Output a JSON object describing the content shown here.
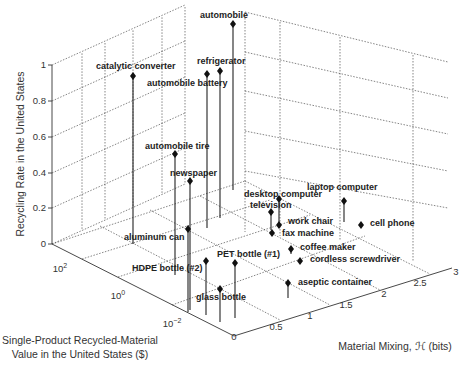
{
  "chart_data": {
    "type": "scatter",
    "subtype": "3d-stem",
    "title": "",
    "xlabel": "Material Mixing, ℋ (bits)",
    "ylabel": "Single-Product Recycled-Material Value in the United States ($)",
    "zlabel": "Recycling Rate in the United States",
    "xlim": [
      0,
      3
    ],
    "ylim_log10": [
      -3,
      3
    ],
    "zlim": [
      0,
      1
    ],
    "x_ticks": [
      "0",
      "0.5",
      "1",
      "1.5",
      "2",
      "2.5",
      "3"
    ],
    "y_ticks": [
      "10−2",
      "10⁰",
      "10²"
    ],
    "z_ticks": [
      "0",
      "0.2",
      "0.4",
      "0.6",
      "0.8",
      "1"
    ],
    "grid": true,
    "points": [
      {
        "label": "automobile",
        "mixing_bits": 0.35,
        "value_log10": 2.6,
        "recycling_rate": 0.98
      },
      {
        "label": "refrigerator",
        "mixing_bits": 0.3,
        "value_log10": 1.5,
        "recycling_rate": 0.9
      },
      {
        "label": "automobile battery",
        "mixing_bits": 0.2,
        "value_log10": 1.2,
        "recycling_rate": 0.95
      },
      {
        "label": "catalytic converter",
        "mixing_bits": 0.05,
        "value_log10": 2.0,
        "recycling_rate": 0.95
      },
      {
        "label": "automobile tire",
        "mixing_bits": 0.15,
        "value_log10": 0.2,
        "recycling_rate": 0.35
      },
      {
        "label": "newspaper",
        "mixing_bits": 0.1,
        "value_log10": -1.0,
        "recycling_rate": 0.5
      },
      {
        "label": "aluminum can",
        "mixing_bits": 0.1,
        "value_log10": -1.5,
        "recycling_rate": 0.45
      },
      {
        "label": "HDPE bottle (#2)",
        "mixing_bits": 0.15,
        "value_log10": -2.2,
        "recycling_rate": 0.3
      },
      {
        "label": "PET bottle (#1)",
        "mixing_bits": 0.3,
        "value_log10": -2.0,
        "recycling_rate": 0.25
      },
      {
        "label": "glass bottle",
        "mixing_bits": 0.25,
        "value_log10": -2.3,
        "recycling_rate": 0.25
      },
      {
        "label": "desktop computer",
        "mixing_bits": 1.7,
        "value_log10": 0.5,
        "recycling_rate": 0.2
      },
      {
        "label": "television",
        "mixing_bits": 1.6,
        "value_log10": 0.8,
        "recycling_rate": 0.15
      },
      {
        "label": "work chair",
        "mixing_bits": 1.6,
        "value_log10": 0.2,
        "recycling_rate": 0.05
      },
      {
        "label": "fax machine",
        "mixing_bits": 1.5,
        "value_log10": 0.6,
        "recycling_rate": 0.02
      },
      {
        "label": "laptop computer",
        "mixing_bits": 2.3,
        "value_log10": 0.5,
        "recycling_rate": 0.1
      },
      {
        "label": "cell phone",
        "mixing_bits": 2.5,
        "value_log10": 0.0,
        "recycling_rate": 0.01
      },
      {
        "label": "coffee maker",
        "mixing_bits": 1.5,
        "value_log10": -0.5,
        "recycling_rate": 0.02
      },
      {
        "label": "cordless screwdriver",
        "mixing_bits": 1.7,
        "value_log10": -0.8,
        "recycling_rate": 0.01
      },
      {
        "label": "aseptic container",
        "mixing_bits": 1.1,
        "value_log10": -2.0,
        "recycling_rate": 0.15
      }
    ]
  },
  "axes": {
    "z_label": "Recycling Rate in the United States",
    "y_label_line1": "Single-Product Recycled-Material",
    "y_label_line2": "Value in the United States ($)",
    "x_label": "Material Mixing, ℋ (bits)",
    "z_ticks": [
      {
        "label": "1",
        "y": 65
      },
      {
        "label": "0.8",
        "y": 101
      },
      {
        "label": "0.6",
        "y": 137
      },
      {
        "label": "0.4",
        "y": 173
      },
      {
        "label": "0.2",
        "y": 208
      },
      {
        "label": "0",
        "y": 244
      }
    ],
    "y_ticks": [
      {
        "label": "10",
        "exp": "2",
        "x": 60,
        "y": 272
      },
      {
        "label": "10",
        "exp": "0",
        "x": 118,
        "y": 299
      },
      {
        "label": "10",
        "exp": "−2",
        "x": 172,
        "y": 327
      }
    ],
    "x_ticks": [
      {
        "label": "0",
        "x": 234,
        "y": 340
      },
      {
        "label": "0.5",
        "x": 276,
        "y": 330
      },
      {
        "label": "1",
        "x": 310,
        "y": 319
      },
      {
        "label": "1.5",
        "x": 346,
        "y": 308
      },
      {
        "label": "2",
        "x": 384,
        "y": 297
      },
      {
        "label": "2.5",
        "x": 420,
        "y": 286
      },
      {
        "label": "3",
        "x": 456,
        "y": 275
      }
    ]
  },
  "stems": [
    {
      "label": "automobile",
      "mx": 233,
      "my": 24,
      "by": 190,
      "lx": 200,
      "ly": 18
    },
    {
      "label": "refrigerator",
      "mx": 220,
      "my": 71,
      "by": 218,
      "lx": 197,
      "ly": 64
    },
    {
      "label": "automobile battery",
      "mx": 207,
      "my": 74,
      "by": 228,
      "lx": 147,
      "ly": 86
    },
    {
      "label": "catalytic converter",
      "mx": 133,
      "my": 76,
      "by": 244,
      "lx": 96,
      "ly": 69
    },
    {
      "label": "automobile tire",
      "mx": 175,
      "my": 154,
      "by": 275,
      "lx": 145,
      "ly": 149
    },
    {
      "label": "newspaper",
      "mx": 190,
      "my": 181,
      "by": 310,
      "lx": 170,
      "ly": 176
    },
    {
      "label": "aluminum can",
      "mx": 188,
      "my": 229,
      "by": 312,
      "lx": 124,
      "ly": 240
    },
    {
      "label": "HDPE bottle (#2)",
      "mx": 206,
      "my": 261,
      "by": 315,
      "lx": 132,
      "ly": 271
    },
    {
      "label": "PET bottle (#1)",
      "mx": 235,
      "my": 263,
      "by": 318,
      "lx": 217,
      "ly": 257
    },
    {
      "label": "glass bottle",
      "mx": 220,
      "my": 289,
      "by": 322,
      "lx": 196,
      "ly": 300
    },
    {
      "label": "desktop computer",
      "mx": 279,
      "my": 199,
      "by": 226,
      "lx": 244,
      "ly": 197
    },
    {
      "label": "television",
      "mx": 271,
      "my": 212,
      "by": 230,
      "lx": 250,
      "ly": 208
    },
    {
      "label": "work chair",
      "mx": 279,
      "my": 225,
      "by": 228,
      "lx": 288,
      "ly": 224
    },
    {
      "label": "fax machine",
      "mx": 272,
      "my": 233,
      "by": 234,
      "lx": 282,
      "ly": 236
    },
    {
      "label": "laptop computer",
      "mx": 344,
      "my": 201,
      "by": 222,
      "lx": 307,
      "ly": 190
    },
    {
      "label": "cell phone",
      "mx": 361,
      "my": 225,
      "by": 226,
      "lx": 370,
      "ly": 226
    },
    {
      "label": "coffee maker",
      "mx": 291,
      "my": 249,
      "by": 254,
      "lx": 300,
      "ly": 250
    },
    {
      "label": "cordless screwdriver",
      "mx": 300,
      "my": 261,
      "by": 262,
      "lx": 310,
      "ly": 262
    },
    {
      "label": "aseptic container",
      "mx": 288,
      "my": 283,
      "by": 298,
      "lx": 298,
      "ly": 285
    }
  ]
}
